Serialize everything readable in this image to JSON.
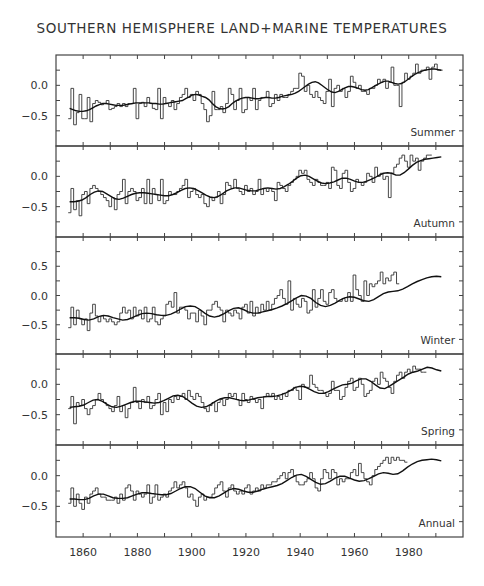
{
  "title": "SOUTHERN HEMISPHERE LAND+MARINE TEMPERATURES",
  "chart_data": {
    "type": "line",
    "title": "SOUTHERN HEMISPHERE LAND+MARINE TEMPERATURES",
    "xlabel": "",
    "ylabel": "",
    "xlim": [
      1850,
      2000
    ],
    "x_ticks": [
      1860,
      1880,
      1900,
      1920,
      1940,
      1960,
      1980
    ],
    "x_minor_step": 10,
    "start_year": 1855,
    "end_year": 1992,
    "grid": false,
    "style": "yearly values drawn as step histogram with overlaid smoothed curve",
    "panels": [
      {
        "name": "Summer",
        "ylim": [
          -1.0,
          0.5
        ],
        "y_ticks": [
          0.0,
          -0.5
        ],
        "values": [
          -0.55,
          -0.05,
          -0.65,
          -0.45,
          -0.15,
          -0.55,
          -0.55,
          -0.2,
          -0.6,
          -0.3,
          -0.25,
          -0.28,
          -0.32,
          -0.3,
          -0.25,
          -0.4,
          -0.38,
          -0.35,
          -0.3,
          -0.35,
          -0.3,
          -0.35,
          -0.3,
          -0.3,
          -0.05,
          -0.55,
          -0.3,
          -0.28,
          -0.35,
          -0.2,
          -0.3,
          -0.38,
          -0.4,
          -0.05,
          -0.55,
          -0.2,
          -0.3,
          -0.35,
          -0.25,
          -0.4,
          -0.3,
          -0.2,
          -0.15,
          -0.05,
          -0.2,
          -0.15,
          -0.25,
          -0.1,
          -0.15,
          -0.3,
          -0.4,
          -0.6,
          -0.5,
          -0.1,
          -0.4,
          -0.4,
          -0.35,
          -0.45,
          -0.3,
          -0.05,
          -0.15,
          -0.4,
          -0.25,
          -0.05,
          -0.45,
          -0.4,
          -0.2,
          -0.25,
          -0.05,
          -0.4,
          -0.25,
          -0.2,
          -0.2,
          -0.1,
          -0.35,
          -0.3,
          -0.15,
          -0.25,
          -0.15,
          -0.2,
          -0.2,
          -0.15,
          -0.1,
          -0.05,
          -0.05,
          0.2,
          0.15,
          -0.1,
          0.0,
          -0.15,
          -0.2,
          -0.1,
          -0.2,
          -0.25,
          -0.3,
          -0.1,
          0.1,
          -0.35,
          -0.05,
          0.0,
          -0.1,
          -0.05,
          -0.2,
          -0.1,
          0.15,
          0.05,
          -0.05,
          0.0,
          -0.1,
          -0.1,
          -0.15,
          -0.05,
          -0.05,
          0.0,
          0.1,
          0.05,
          0.1,
          -0.05,
          0.05,
          0.3,
          0.0,
          0.0,
          -0.35,
          0.05,
          0.2,
          0.1,
          0.15,
          0.2,
          0.35,
          0.2,
          0.25,
          0.25,
          0.3,
          0.1,
          0.3,
          0.35,
          0.25,
          0.25
        ],
        "smoothed": [
          -0.38,
          -0.4,
          -0.42,
          -0.43,
          -0.43,
          -0.42,
          -0.4,
          -0.37,
          -0.34,
          -0.32,
          -0.3,
          -0.3,
          -0.31,
          -0.32,
          -0.33,
          -0.33,
          -0.33,
          -0.32,
          -0.31,
          -0.3,
          -0.29,
          -0.29,
          -0.29,
          -0.29,
          -0.29,
          -0.3,
          -0.3,
          -0.31,
          -0.31,
          -0.3,
          -0.29,
          -0.28,
          -0.27,
          -0.26,
          -0.25,
          -0.22,
          -0.19,
          -0.16,
          -0.15,
          -0.16,
          -0.18,
          -0.2,
          -0.24,
          -0.3,
          -0.35,
          -0.38,
          -0.39,
          -0.38,
          -0.35,
          -0.3,
          -0.26,
          -0.23,
          -0.21,
          -0.2,
          -0.2,
          -0.21,
          -0.22,
          -0.22,
          -0.21,
          -0.2,
          -0.2,
          -0.21,
          -0.21,
          -0.2,
          -0.18,
          -0.17,
          -0.16,
          -0.15,
          -0.13,
          -0.1,
          -0.06,
          -0.02,
          0.02,
          0.05,
          0.06,
          0.04,
          0.0,
          -0.04,
          -0.08,
          -0.11,
          -0.12,
          -0.1,
          -0.07,
          -0.04,
          -0.02,
          -0.02,
          -0.03,
          -0.05,
          -0.07,
          -0.08,
          -0.07,
          -0.04,
          -0.01,
          0.02,
          0.05,
          0.07,
          0.07,
          0.05,
          0.03,
          0.02,
          0.03,
          0.06,
          0.1,
          0.14,
          0.18,
          0.21,
          0.23,
          0.25,
          0.26,
          0.27,
          0.27,
          0.26,
          0.25
        ]
      },
      {
        "name": "Autumn",
        "ylim": [
          -1.0,
          0.5
        ],
        "y_ticks": [
          0.0,
          -0.5
        ],
        "values": [
          -0.6,
          -0.2,
          -0.55,
          -0.4,
          -0.65,
          -0.3,
          -0.25,
          -0.45,
          -0.2,
          -0.15,
          -0.2,
          -0.25,
          -0.3,
          -0.35,
          -0.4,
          -0.5,
          -0.35,
          -0.55,
          -0.3,
          -0.25,
          -0.05,
          -0.45,
          -0.25,
          -0.2,
          -0.25,
          -0.4,
          -0.35,
          -0.2,
          -0.45,
          -0.05,
          -0.45,
          -0.2,
          -0.3,
          -0.4,
          -0.05,
          -0.45,
          -0.4,
          -0.25,
          -0.3,
          -0.3,
          -0.25,
          -0.2,
          -0.15,
          -0.05,
          -0.35,
          -0.25,
          -0.2,
          -0.3,
          -0.35,
          -0.3,
          -0.45,
          -0.5,
          -0.35,
          -0.4,
          -0.35,
          -0.25,
          -0.45,
          -0.3,
          -0.1,
          -0.15,
          -0.2,
          -0.05,
          -0.2,
          -0.25,
          -0.3,
          -0.15,
          -0.25,
          -0.2,
          -0.3,
          -0.25,
          -0.05,
          -0.3,
          -0.2,
          -0.25,
          -0.2,
          -0.25,
          -0.4,
          -0.1,
          -0.15,
          -0.2,
          -0.25,
          -0.15,
          -0.1,
          -0.05,
          0.0,
          0.1,
          0.05,
          0.1,
          -0.05,
          -0.1,
          -0.15,
          -0.05,
          -0.1,
          -0.15,
          -0.15,
          -0.1,
          -0.2,
          0.15,
          0.1,
          -0.15,
          -0.2,
          0.05,
          0.1,
          -0.1,
          -0.25,
          -0.2,
          -0.05,
          -0.1,
          -0.15,
          -0.1,
          0.05,
          0.0,
          -0.1,
          0.15,
          0.0,
          0.05,
          -0.05,
          0.0,
          -0.35,
          0.05,
          0.15,
          0.2,
          0.3,
          0.35,
          0.25,
          0.15,
          0.35,
          0.25,
          0.3,
          0.1,
          0.25,
          0.3,
          0.35,
          0.35
        ],
        "smoothed": [
          -0.42,
          -0.42,
          -0.41,
          -0.39,
          -0.35,
          -0.3,
          -0.26,
          -0.24,
          -0.25,
          -0.29,
          -0.33,
          -0.37,
          -0.38,
          -0.36,
          -0.33,
          -0.3,
          -0.28,
          -0.27,
          -0.27,
          -0.28,
          -0.29,
          -0.3,
          -0.31,
          -0.32,
          -0.32,
          -0.3,
          -0.27,
          -0.23,
          -0.2,
          -0.19,
          -0.2,
          -0.23,
          -0.27,
          -0.31,
          -0.34,
          -0.35,
          -0.33,
          -0.29,
          -0.24,
          -0.21,
          -0.19,
          -0.19,
          -0.21,
          -0.23,
          -0.24,
          -0.24,
          -0.22,
          -0.2,
          -0.19,
          -0.2,
          -0.21,
          -0.2,
          -0.17,
          -0.13,
          -0.08,
          -0.03,
          0.01,
          0.02,
          0.0,
          -0.04,
          -0.08,
          -0.11,
          -0.12,
          -0.11,
          -0.09,
          -0.06,
          -0.03,
          -0.03,
          -0.05,
          -0.08,
          -0.1,
          -0.1,
          -0.08,
          -0.05,
          -0.02,
          0.02,
          0.05,
          0.06,
          0.05,
          0.02,
          0.02,
          0.06,
          0.12,
          0.18,
          0.23,
          0.26,
          0.28,
          0.29,
          0.3,
          0.31,
          0.32
        ]
      },
      {
        "name": "Winter",
        "ylim": [
          -1.0,
          1.0
        ],
        "y_ticks": [
          0.5,
          0.0,
          -0.5
        ],
        "values": [
          -0.55,
          -0.2,
          -0.5,
          -0.25,
          -0.4,
          -0.5,
          -0.4,
          -0.6,
          -0.3,
          -0.15,
          -0.35,
          -0.45,
          -0.35,
          -0.4,
          -0.45,
          -0.4,
          -0.45,
          -0.5,
          -0.45,
          -0.3,
          -0.2,
          -0.3,
          -0.25,
          -0.4,
          -0.2,
          -0.35,
          -0.25,
          -0.4,
          -0.2,
          -0.45,
          -0.4,
          -0.2,
          -0.45,
          -0.5,
          -0.4,
          -0.35,
          -0.15,
          -0.1,
          -0.2,
          0.05,
          -0.3,
          -0.2,
          -0.2,
          -0.25,
          -0.4,
          -0.3,
          -0.3,
          -0.45,
          -0.25,
          -0.35,
          -0.5,
          -0.25,
          -0.25,
          -0.15,
          -0.1,
          -0.2,
          -0.25,
          -0.45,
          -0.25,
          -0.3,
          -0.35,
          -0.25,
          -0.3,
          -0.4,
          -0.2,
          -0.15,
          -0.3,
          -0.1,
          -0.35,
          -0.2,
          -0.3,
          -0.15,
          -0.25,
          -0.1,
          -0.25,
          -0.15,
          -0.05,
          0.0,
          0.1,
          -0.05,
          -0.15,
          0.25,
          -0.25,
          -0.05,
          -0.15,
          -0.2,
          -0.05,
          -0.1,
          -0.3,
          -0.25,
          0.1,
          -0.2,
          -0.05,
          0.1,
          -0.1,
          -0.15,
          0.05,
          0.1,
          -0.05,
          -0.1,
          -0.1,
          -0.05,
          -0.1,
          0.05,
          -0.1,
          0.35,
          0.1,
          0.0,
          -0.1,
          0.25,
          0.0,
          0.2,
          0.15,
          0.2,
          0.25,
          0.4,
          0.2,
          0.3,
          0.25,
          0.35,
          0.4,
          0.2
        ],
        "smoothed": [
          -0.38,
          -0.38,
          -0.39,
          -0.41,
          -0.42,
          -0.4,
          -0.36,
          -0.34,
          -0.35,
          -0.38,
          -0.4,
          -0.42,
          -0.41,
          -0.38,
          -0.34,
          -0.31,
          -0.3,
          -0.31,
          -0.33,
          -0.34,
          -0.34,
          -0.32,
          -0.28,
          -0.23,
          -0.19,
          -0.18,
          -0.19,
          -0.24,
          -0.3,
          -0.35,
          -0.37,
          -0.35,
          -0.31,
          -0.26,
          -0.22,
          -0.21,
          -0.24,
          -0.28,
          -0.3,
          -0.3,
          -0.28,
          -0.26,
          -0.24,
          -0.21,
          -0.18,
          -0.14,
          -0.09,
          -0.04,
          0.0,
          -0.01,
          -0.05,
          -0.12,
          -0.17,
          -0.19,
          -0.17,
          -0.13,
          -0.08,
          -0.04,
          -0.02,
          -0.03,
          -0.06,
          -0.09,
          -0.1,
          -0.07,
          -0.02,
          0.03,
          0.06,
          0.07,
          0.08,
          0.11,
          0.15,
          0.2,
          0.24,
          0.27,
          0.3,
          0.32,
          0.33,
          0.32
        ]
      },
      {
        "name": "Spring",
        "ylim": [
          -1.0,
          0.5
        ],
        "y_ticks": [
          0.0,
          -0.5
        ],
        "values": [
          -0.4,
          -0.2,
          -0.65,
          -0.3,
          -0.35,
          -0.25,
          -0.4,
          -0.5,
          -0.4,
          -0.35,
          -0.25,
          -0.15,
          -0.25,
          -0.3,
          -0.35,
          -0.4,
          -0.45,
          -0.35,
          -0.2,
          -0.45,
          -0.35,
          -0.55,
          -0.4,
          -0.3,
          -0.05,
          -0.3,
          -0.4,
          -0.25,
          -0.3,
          -0.2,
          -0.4,
          -0.35,
          -0.25,
          -0.15,
          -0.5,
          -0.3,
          -0.45,
          -0.25,
          -0.3,
          -0.2,
          -0.25,
          -0.2,
          -0.15,
          -0.25,
          -0.1,
          -0.2,
          -0.25,
          -0.15,
          -0.2,
          -0.3,
          -0.4,
          -0.45,
          -0.35,
          -0.3,
          -0.45,
          -0.3,
          -0.25,
          -0.35,
          -0.25,
          -0.15,
          -0.2,
          -0.15,
          -0.25,
          -0.35,
          -0.15,
          -0.25,
          -0.3,
          -0.2,
          -0.25,
          -0.3,
          -0.25,
          -0.4,
          -0.2,
          -0.15,
          -0.2,
          -0.15,
          -0.25,
          -0.2,
          -0.25,
          -0.15,
          -0.2,
          -0.1,
          -0.1,
          -0.05,
          -0.1,
          -0.25,
          0.0,
          -0.05,
          -0.05,
          0.15,
          0.0,
          -0.05,
          -0.1,
          -0.1,
          -0.15,
          -0.2,
          -0.15,
          0.05,
          -0.1,
          -0.1,
          -0.25,
          -0.2,
          -0.05,
          0.05,
          0.1,
          -0.1,
          -0.05,
          0.1,
          0.0,
          -0.2,
          -0.15,
          -0.1,
          0.05,
          0.1,
          0.0,
          0.2,
          0.1,
          0.05,
          -0.05,
          -0.15,
          0.05,
          0.15,
          0.2,
          0.1,
          0.2,
          0.25,
          0.2,
          0.3,
          0.25,
          0.25,
          0.2,
          0.2
        ],
        "smoothed": [
          -0.38,
          -0.37,
          -0.36,
          -0.34,
          -0.3,
          -0.26,
          -0.25,
          -0.28,
          -0.33,
          -0.37,
          -0.38,
          -0.36,
          -0.33,
          -0.3,
          -0.28,
          -0.28,
          -0.29,
          -0.3,
          -0.31,
          -0.3,
          -0.27,
          -0.23,
          -0.19,
          -0.18,
          -0.2,
          -0.25,
          -0.31,
          -0.36,
          -0.38,
          -0.37,
          -0.33,
          -0.28,
          -0.24,
          -0.22,
          -0.22,
          -0.24,
          -0.26,
          -0.27,
          -0.26,
          -0.24,
          -0.22,
          -0.21,
          -0.2,
          -0.2,
          -0.19,
          -0.17,
          -0.14,
          -0.1,
          -0.05,
          -0.03,
          -0.04,
          -0.08,
          -0.12,
          -0.15,
          -0.15,
          -0.12,
          -0.08,
          -0.04,
          -0.01,
          0.0,
          0.02,
          0.06,
          0.09,
          0.09,
          0.05,
          -0.01,
          -0.06,
          -0.07,
          -0.03,
          0.02,
          0.07,
          0.12,
          0.17,
          0.2,
          0.22,
          0.25,
          0.28,
          0.27,
          0.24,
          0.22
        ]
      },
      {
        "name": "Annual",
        "ylim": [
          -1.0,
          0.5
        ],
        "y_ticks": [
          0.0,
          -0.5
        ],
        "values": [
          -0.45,
          -0.2,
          -0.5,
          -0.3,
          -0.45,
          -0.55,
          -0.35,
          -0.45,
          -0.3,
          -0.25,
          -0.2,
          -0.3,
          -0.35,
          -0.35,
          -0.4,
          -0.4,
          -0.4,
          -0.35,
          -0.45,
          -0.3,
          -0.4,
          -0.2,
          -0.15,
          -0.25,
          -0.4,
          -0.25,
          -0.3,
          -0.35,
          -0.3,
          -0.15,
          -0.45,
          -0.35,
          -0.15,
          -0.4,
          -0.35,
          -0.3,
          -0.35,
          -0.25,
          -0.2,
          -0.1,
          -0.2,
          -0.15,
          -0.1,
          -0.2,
          -0.35,
          -0.3,
          -0.4,
          -0.5,
          -0.35,
          -0.3,
          -0.4,
          -0.35,
          -0.35,
          -0.3,
          -0.2,
          -0.15,
          -0.1,
          -0.25,
          -0.35,
          -0.2,
          -0.15,
          -0.25,
          -0.3,
          -0.25,
          -0.3,
          -0.2,
          -0.15,
          -0.3,
          -0.25,
          -0.2,
          -0.25,
          -0.15,
          -0.2,
          -0.15,
          -0.15,
          -0.1,
          -0.1,
          -0.05,
          0.0,
          0.05,
          -0.05,
          0.05,
          0.1,
          0.0,
          -0.1,
          -0.15,
          -0.15,
          -0.1,
          -0.05,
          0.05,
          -0.05,
          -0.2,
          -0.25,
          -0.05,
          0.1,
          0.05,
          -0.05,
          0.1,
          0.05,
          -0.15,
          -0.05,
          -0.1,
          -0.05,
          -0.05,
          0.05,
          0.1,
          0.0,
          0.2,
          0.05,
          -0.05,
          -0.1,
          -0.15,
          0.0,
          0.1,
          0.15,
          0.2,
          0.25,
          0.3,
          0.2,
          0.3,
          0.25,
          0.3,
          0.25,
          0.25,
          0.22
        ],
        "smoothed": [
          -0.38,
          -0.38,
          -0.39,
          -0.39,
          -0.37,
          -0.33,
          -0.3,
          -0.3,
          -0.33,
          -0.36,
          -0.37,
          -0.37,
          -0.36,
          -0.33,
          -0.3,
          -0.28,
          -0.28,
          -0.29,
          -0.3,
          -0.31,
          -0.31,
          -0.29,
          -0.25,
          -0.21,
          -0.18,
          -0.18,
          -0.21,
          -0.27,
          -0.33,
          -0.36,
          -0.36,
          -0.33,
          -0.28,
          -0.23,
          -0.21,
          -0.22,
          -0.25,
          -0.27,
          -0.27,
          -0.25,
          -0.22,
          -0.2,
          -0.18,
          -0.16,
          -0.13,
          -0.08,
          -0.03,
          0.01,
          0.02,
          -0.01,
          -0.06,
          -0.11,
          -0.14,
          -0.13,
          -0.09,
          -0.04,
          -0.01,
          -0.01,
          -0.04,
          -0.07,
          -0.09,
          -0.08,
          -0.05,
          -0.01,
          0.03,
          0.05,
          0.04,
          0.02,
          0.03,
          0.08,
          0.14,
          0.19,
          0.23,
          0.25,
          0.26,
          0.27,
          0.26,
          0.24
        ]
      }
    ]
  }
}
